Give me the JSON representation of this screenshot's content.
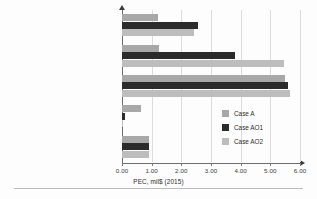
{
  "chart_data": {
    "type": "bar",
    "orientation": "horizontal",
    "title": "",
    "xlabel": "PEC, mil$ (2015)",
    "ylabel": "",
    "xlim": [
      0.0,
      6.0
    ],
    "xticks": [
      "0.00",
      "1.00",
      "2.00",
      "3.00",
      "4.00",
      "5.00",
      "6.00"
    ],
    "grid": true,
    "legend_position": "center-right",
    "categories": [
      "others",
      "Nitrogen liquefaction block",
      "Column block",
      "Liquefaction of the air",
      "Air compression and purification block"
    ],
    "series": [
      {
        "name": "Case A",
        "color": "#a8a8a8",
        "values": [
          1.2,
          1.25,
          5.5,
          0.65,
          0.92
        ]
      },
      {
        "name": "Case AO1",
        "color": "#2b2b2b",
        "values": [
          2.55,
          3.8,
          5.6,
          0.1,
          0.92
        ]
      },
      {
        "name": "Case AO2",
        "color": "#bdbdbd",
        "values": [
          2.42,
          5.45,
          5.65,
          0.03,
          0.92
        ]
      }
    ]
  }
}
